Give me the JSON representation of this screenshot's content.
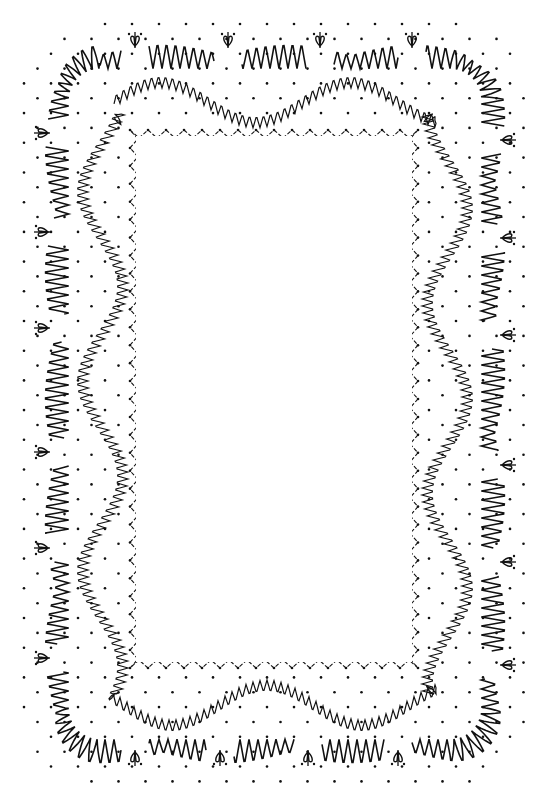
{
  "canvas": {
    "width": 548,
    "height": 794,
    "background": "#ffffff",
    "ink": "#111111"
  },
  "pattern": {
    "kind": "bobbin-lace-pricking-border",
    "outer_frame": {
      "x1": 30,
      "y1": 30,
      "x2": 520,
      "y2": 778,
      "corner_radius": 70
    },
    "inner_window": {
      "x1": 130,
      "y1": 130,
      "x2": 418,
      "y2": 668
    },
    "dot_spacing": 27,
    "outer_band": {
      "inset": 35,
      "amplitude": 26,
      "cycle": 9
    },
    "middle_band": {
      "inset": 78,
      "amplitude": 12,
      "cycle": 7,
      "wave": 20,
      "wave_period": 190
    },
    "inner_zigzag": {
      "amplitude": 4,
      "cycle": 18
    },
    "tallies": {
      "top": [
        135,
        228,
        320,
        412
      ],
      "bottom": [
        135,
        220,
        308,
        398
      ],
      "left": [
        133,
        232,
        328,
        452,
        548,
        658
      ],
      "right": [
        140,
        238,
        335,
        465,
        562,
        665
      ]
    }
  }
}
